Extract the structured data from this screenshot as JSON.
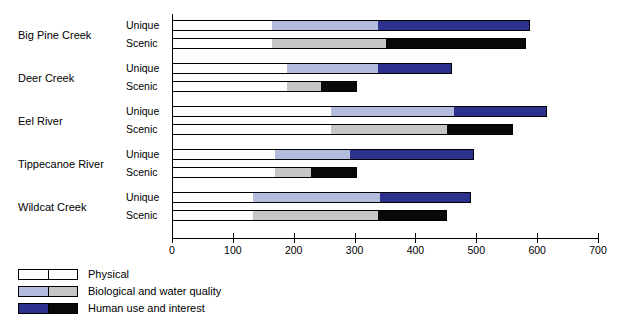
{
  "chart_data": {
    "type": "bar",
    "orientation": "horizontal",
    "stacked": true,
    "title": "",
    "xlabel": "",
    "ylabel": "",
    "xlim": [
      0,
      700
    ],
    "xticks": [
      0,
      100,
      200,
      300,
      400,
      500,
      600,
      700
    ],
    "xtick_labels": [
      "0",
      "100",
      "200",
      "300",
      "400",
      "500",
      "600",
      "700"
    ],
    "grid": false,
    "legend_position": "bottom-left",
    "categories": [
      "Big Pine Creek",
      "Deer Creek",
      "Eel River",
      "Tippecanoe River",
      "Wildcat Creek"
    ],
    "subcategories": [
      "Unique",
      "Scenic"
    ],
    "segment_names": [
      "Physical",
      "Biological and water quality",
      "Human use and interest"
    ],
    "series": [
      {
        "name": "Physical",
        "colors": {
          "Unique": "#ffffff",
          "Scenic": "#ffffff"
        },
        "values": {
          "Unique": [
            163,
            187,
            259,
            168,
            131
          ],
          "Scenic": [
            163,
            187,
            259,
            168,
            131
          ]
        }
      },
      {
        "name": "Biological and water quality",
        "colors": {
          "Unique": "#b3bcdc",
          "Scenic": "#c6c6c6"
        },
        "values": {
          "Unique": [
            174,
            150,
            202,
            123,
            209
          ],
          "Scenic": [
            187,
            57,
            191,
            59,
            206
          ]
        }
      },
      {
        "name": "Human use and interest",
        "colors": {
          "Unique": "#2b318c",
          "Scenic": "#080808"
        },
        "values": {
          "Unique": [
            250,
            121,
            154,
            204,
            150
          ],
          "Scenic": [
            230,
            59,
            108,
            75,
            113
          ]
        }
      }
    ],
    "cumulative_totals": {
      "Unique": [
        587,
        458,
        615,
        495,
        490
      ],
      "Scenic": [
        580,
        303,
        558,
        302,
        450
      ]
    },
    "segment_boundaries": {
      "Big Pine Creek": {
        "Unique": [
          163,
          337,
          587
        ],
        "Scenic": [
          163,
          350,
          580
        ]
      },
      "Deer Creek": {
        "Unique": [
          187,
          337,
          458
        ],
        "Scenic": [
          187,
          244,
          303
        ]
      },
      "Eel River": {
        "Unique": [
          259,
          461,
          615
        ],
        "Scenic": [
          259,
          450,
          558
        ]
      },
      "Tippecanoe River": {
        "Unique": [
          168,
          291,
          495
        ],
        "Scenic": [
          168,
          227,
          302
        ]
      },
      "Wildcat Creek": {
        "Unique": [
          131,
          340,
          490
        ],
        "Scenic": [
          131,
          337,
          450
        ]
      }
    }
  },
  "axis": {
    "tick_labels": [
      "0",
      "100",
      "200",
      "300",
      "400",
      "500",
      "600",
      "700"
    ]
  },
  "groups": [
    {
      "label": "Big Pine Creek",
      "unique_label": "Unique",
      "scenic_label": "Scenic"
    },
    {
      "label": "Deer Creek",
      "unique_label": "Unique",
      "scenic_label": "Scenic"
    },
    {
      "label": "Eel River",
      "unique_label": "Unique",
      "scenic_label": "Scenic"
    },
    {
      "label": "Tippecanoe River",
      "unique_label": "Unique",
      "scenic_label": "Scenic"
    },
    {
      "label": "Wildcat Creek",
      "unique_label": "Unique",
      "scenic_label": "Scenic"
    }
  ],
  "legend": {
    "items": [
      {
        "label": "Physical",
        "unique_color": "#ffffff",
        "scenic_color": "#ffffff"
      },
      {
        "label": "Biological and water quality",
        "unique_color": "#b3bcdc",
        "scenic_color": "#c6c6c6"
      },
      {
        "label": "Human use and interest",
        "unique_color": "#2b318c",
        "scenic_color": "#080808"
      }
    ]
  }
}
